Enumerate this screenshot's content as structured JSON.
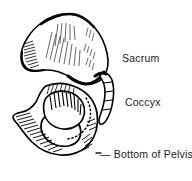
{
  "figure": {
    "name": "pelvis-lateral-view-illustration",
    "background_color": "#ffffff",
    "ink_color": "#000000",
    "text_color": "#1a1a1a",
    "style": "black-and-white line art with cross-hatching"
  },
  "labels": {
    "sacrum": "Sacrum",
    "coccyx": "Coccyx",
    "bottom_of_pelvis": "— Bottom of Pelvis"
  },
  "structures": {
    "ilium": "ilium",
    "sacrum": "sacrum",
    "coccyx": "coccyx",
    "acetabulum": "acetabulum",
    "obturator_foramen": "obturator-foramen",
    "ischium": "ischium",
    "pubis": "pubis"
  }
}
